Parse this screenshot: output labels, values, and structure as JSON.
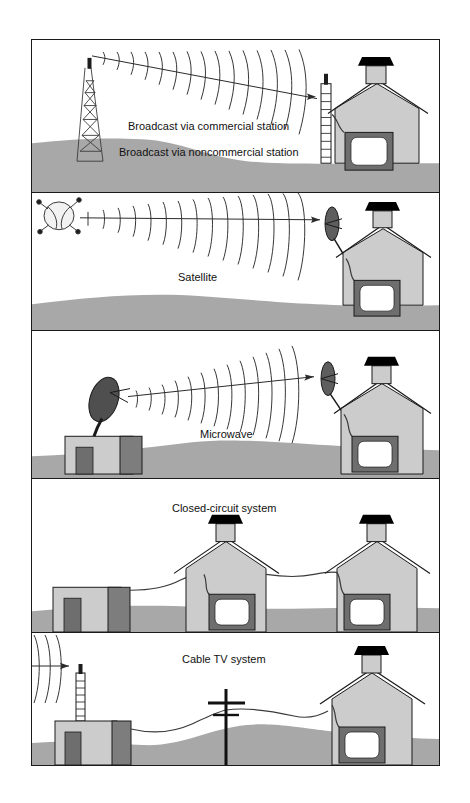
{
  "figure": {
    "frame_color": "#1a1a1a",
    "background": "#ffffff"
  },
  "palette": {
    "ground": "#a8a8a8",
    "ground_dark": "#9a9a9a",
    "building_light": "#cccccc",
    "building_dark": "#7d7d7d",
    "tv_frame": "#6e6e6e",
    "tv_screen": "#ffffff",
    "roof_cap": "#000000",
    "line": "#1a1a1a",
    "wave": "#2b2b2b",
    "text": "#111111"
  },
  "panels": [
    {
      "id": "broadcast",
      "labels": [
        "Broadcast via commercial station",
        "Broadcast via noncommercial station"
      ],
      "elements": {
        "transmitter": "lattice-broadcast-tower",
        "receiver": "rooftop-mast-antenna",
        "house": "receiving-house",
        "tv": "television-set",
        "wave": "radio-wave-arcs"
      }
    },
    {
      "id": "satellite",
      "labels": [
        "Satellite"
      ],
      "elements": {
        "transmitter": "orbiting-satellite",
        "receiver": "satellite-dish",
        "house": "receiving-house",
        "tv": "television-set",
        "wave": "radio-wave-arcs"
      }
    },
    {
      "id": "microwave",
      "labels": [
        "Microwave"
      ],
      "elements": {
        "transmitter": "microwave-dish-on-station",
        "station": "transmitting-station-building",
        "receiver": "satellite-dish",
        "house": "receiving-house",
        "tv": "television-set",
        "wave": "radio-wave-arcs"
      }
    },
    {
      "id": "closed-circuit",
      "labels": [
        "Closed-circuit system"
      ],
      "elements": {
        "source": "head-end-building",
        "cable": "coaxial-cable-run",
        "house_a": "receiving-house",
        "house_b": "receiving-house",
        "tv_a": "television-set",
        "tv_b": "television-set"
      }
    },
    {
      "id": "cable-tv",
      "labels": [
        "Cable TV system"
      ],
      "elements": {
        "antenna": "head-end-mast-antenna",
        "source": "cable-head-end-building",
        "pole": "utility-pole",
        "cable": "coaxial-cable-run",
        "house": "receiving-house",
        "tv": "television-set",
        "wave": "incoming-radio-wave-arcs"
      }
    }
  ]
}
